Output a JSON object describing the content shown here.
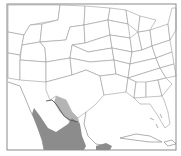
{
  "map": {
    "title": "",
    "region": "Contiguous United States, northern Mexico and Caribbean",
    "colors": {
      "background": "#ffffff",
      "state_borders": "#9a9a9a",
      "frame": "#8a8a8a",
      "range_core": "#8c8c8c",
      "range_edge": "#b4b4b4",
      "river": "#555555"
    },
    "layers": [
      {
        "name": "state-boundaries",
        "type": "lines"
      },
      {
        "name": "distribution-range-core",
        "type": "polygon",
        "area": "Northeastern Mexico (Coahuila, Nuevo León, Tamaulipas) and western Gulf coast"
      },
      {
        "name": "distribution-range-edge",
        "type": "polygon",
        "area": "South Texas along the Rio Grande"
      },
      {
        "name": "rio-grande",
        "type": "line"
      },
      {
        "name": "distribution-range-yucatan",
        "type": "polygon",
        "area": "Southern Gulf of Mexico coast"
      }
    ],
    "labels": []
  }
}
